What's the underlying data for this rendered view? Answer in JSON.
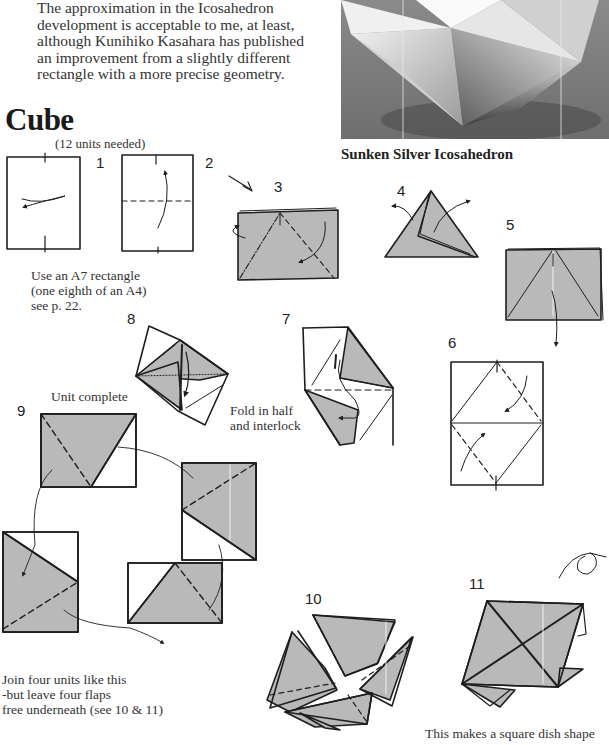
{
  "intro": {
    "lines": [
      "The approximation in the Icosahedron",
      "development is acceptable to me, at least,",
      "although Kunihiko Kasahara has published",
      "an improvement from a slightly different",
      "rectangle with a more precise geometry."
    ]
  },
  "section": {
    "title": "Cube",
    "subtitle": "(12 units needed)"
  },
  "photo": {
    "caption": "Sunken Silver Icosahedron",
    "icon": "origami-icosahedron-photo"
  },
  "steps": [
    {
      "num": "1"
    },
    {
      "num": "2"
    },
    {
      "num": "3"
    },
    {
      "num": "4"
    },
    {
      "num": "5"
    },
    {
      "num": "6"
    },
    {
      "num": "7"
    },
    {
      "num": "8"
    },
    {
      "num": "9"
    },
    {
      "num": "10"
    },
    {
      "num": "11"
    }
  ],
  "captions": {
    "a7": [
      "Use an A7 rectangle",
      "(one eighth of an A4)",
      "see p. 22."
    ],
    "unit_complete": "Unit complete",
    "fold_interlock": [
      "Fold in half",
      "and interlock"
    ],
    "join": [
      "Join four units like this",
      "-but leave four flaps",
      "free underneath (see 10 & 11)"
    ],
    "dish": "This makes a square dish shape"
  },
  "colors": {
    "paper_grey": "#b9b9b9",
    "line": "#1e1e1e",
    "text": "#333333"
  }
}
